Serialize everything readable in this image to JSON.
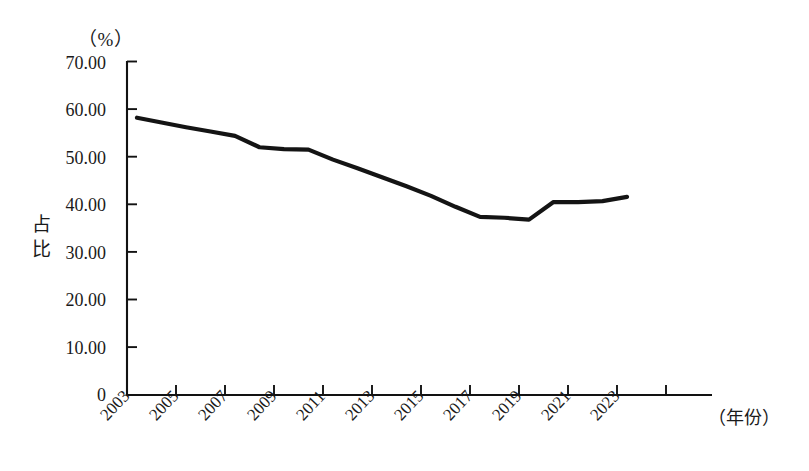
{
  "chart_data": {
    "type": "line",
    "title": "",
    "subtitle": "",
    "xlabel": "（年份）",
    "ylabel": "占比",
    "y_unit": "（%）",
    "ylim": [
      0,
      70
    ],
    "xlim": [
      2003,
      2024
    ],
    "grid": false,
    "legend": null,
    "y_ticks": [
      "0",
      "10.00",
      "20.00",
      "30.00",
      "40.00",
      "50.00",
      "60.00",
      "70.00"
    ],
    "y_tick_values": [
      0,
      10,
      20,
      30,
      40,
      50,
      60,
      70
    ],
    "x_tick_labels": [
      "2003",
      "2005",
      "2007",
      "2009",
      "2011",
      "2013",
      "2015",
      "2017",
      "2019",
      "2021",
      "2023"
    ],
    "x_tick_values": [
      2003,
      2005,
      2007,
      2009,
      2011,
      2013,
      2015,
      2017,
      2019,
      2021,
      2023
    ],
    "x": [
      2003,
      2004,
      2005,
      2006,
      2007,
      2008,
      2009,
      2010,
      2011,
      2012,
      2013,
      2014,
      2015,
      2016,
      2017,
      2018,
      2019,
      2020,
      2021,
      2022,
      2023
    ],
    "values": [
      58.2,
      57.2,
      56.2,
      55.3,
      54.4,
      52.0,
      51.6,
      51.5,
      49.4,
      47.6,
      45.7,
      43.8,
      41.8,
      39.5,
      37.4,
      37.2,
      36.8,
      40.5,
      40.5,
      40.7,
      41.6
    ],
    "series": [
      {
        "name": "占比",
        "color": "#141414",
        "values": [
          58.2,
          57.2,
          56.2,
          55.3,
          54.4,
          52.0,
          51.6,
          51.5,
          49.4,
          47.6,
          45.7,
          43.8,
          41.8,
          39.5,
          37.4,
          37.2,
          36.8,
          40.5,
          40.5,
          40.7,
          41.6
        ]
      }
    ]
  },
  "colors": {
    "background": "#ffffff",
    "axis": "#121212",
    "line": "#141414",
    "text": "#1a1a1a"
  }
}
